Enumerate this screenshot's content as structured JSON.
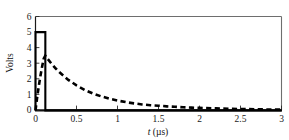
{
  "figure": {
    "background_color": "#ffffff",
    "frame_color": "#6e6e6e",
    "axis_color": "#111111"
  },
  "chart_data": {
    "type": "line",
    "title": "",
    "xlabel": "t (µs)",
    "xlabel_symbol": "t",
    "xlabel_units": "(µs)",
    "ylabel": "Volts",
    "xlim": [
      0,
      3
    ],
    "ylim": [
      0,
      6
    ],
    "xticks": [
      0,
      0.5,
      1,
      1.5,
      2,
      2.5,
      3
    ],
    "xticklabels": [
      "0",
      "0.5",
      "1",
      "1.5",
      "2",
      "2.5",
      "3"
    ],
    "yticks": [
      0,
      1,
      2,
      3,
      4,
      5,
      6
    ],
    "yticklabels": [
      "0",
      "1",
      "2",
      "3",
      "4",
      "5",
      "6"
    ],
    "grid": false,
    "legend": "none",
    "series": [
      {
        "name": "input pulse",
        "style": "solid",
        "color": "#000000",
        "x": [
          0,
          0,
          0.12,
          0.12,
          3
        ],
        "values": [
          0,
          5,
          5,
          0,
          0
        ]
      },
      {
        "name": "output response",
        "style": "dashed",
        "color": "#000000",
        "x": [
          0,
          0.02,
          0.04,
          0.06,
          0.08,
          0.1,
          0.12,
          0.15,
          0.2,
          0.25,
          0.3,
          0.4,
          0.5,
          0.6,
          0.7,
          0.8,
          0.9,
          1.0,
          1.1,
          1.2,
          1.3,
          1.4,
          1.5,
          1.6,
          1.7,
          1.8,
          1.9,
          2.0,
          2.2,
          2.4,
          2.6,
          2.8,
          3.0
        ],
        "values": [
          0,
          0.82,
          1.55,
          2.2,
          2.78,
          3.3,
          3.5,
          3.28,
          2.95,
          2.66,
          2.4,
          1.95,
          1.6,
          1.31,
          1.08,
          0.9,
          0.75,
          0.63,
          0.53,
          0.45,
          0.38,
          0.33,
          0.3,
          0.26,
          0.23,
          0.2,
          0.18,
          0.16,
          0.13,
          0.1,
          0.08,
          0.06,
          0.05
        ]
      }
    ]
  }
}
